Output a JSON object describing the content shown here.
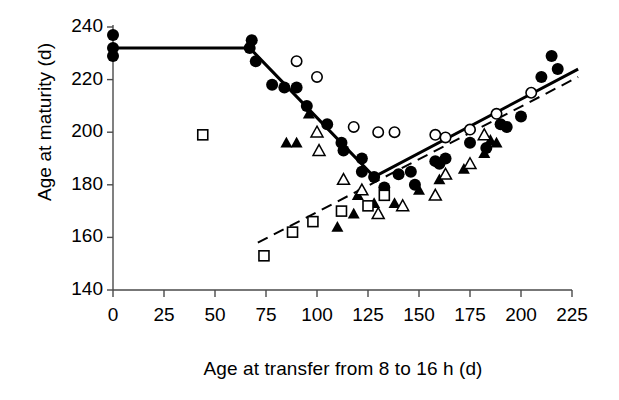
{
  "chart_data": {
    "type": "scatter",
    "title": "",
    "xlabel": "Age at transfer from 8 to 16 h (d)",
    "ylabel": "Age at maturity (d)",
    "xlim": [
      0,
      225
    ],
    "ylim": [
      140,
      240
    ],
    "xticks": [
      0,
      25,
      50,
      75,
      100,
      125,
      150,
      175,
      200,
      225
    ],
    "yticks": [
      140,
      160,
      180,
      200,
      220,
      240
    ],
    "grid": false,
    "legend": "none",
    "series": [
      {
        "name": "filled-circle",
        "marker": "filled-circle",
        "points": [
          [
            0,
            229
          ],
          [
            0,
            232
          ],
          [
            0,
            237
          ],
          [
            67,
            232
          ],
          [
            68,
            235
          ],
          [
            70,
            227
          ],
          [
            78,
            218
          ],
          [
            84,
            217
          ],
          [
            90,
            217
          ],
          [
            95,
            210
          ],
          [
            105,
            203
          ],
          [
            112,
            196
          ],
          [
            113,
            193
          ],
          [
            122,
            190
          ],
          [
            122,
            185
          ],
          [
            128,
            183
          ],
          [
            133,
            179
          ],
          [
            140,
            184
          ],
          [
            146,
            185
          ],
          [
            148,
            180
          ],
          [
            158,
            189
          ],
          [
            160,
            188
          ],
          [
            163,
            190
          ],
          [
            175,
            196
          ],
          [
            183,
            194
          ],
          [
            190,
            203
          ],
          [
            193,
            202
          ],
          [
            200,
            206
          ],
          [
            210,
            221
          ],
          [
            215,
            229
          ],
          [
            218,
            224
          ]
        ]
      },
      {
        "name": "open-circle",
        "marker": "open-circle",
        "points": [
          [
            90,
            227
          ],
          [
            100,
            221
          ],
          [
            118,
            202
          ],
          [
            130,
            200
          ],
          [
            138,
            200
          ],
          [
            158,
            199
          ],
          [
            163,
            198
          ],
          [
            175,
            201
          ],
          [
            188,
            207
          ],
          [
            205,
            215
          ]
        ]
      },
      {
        "name": "filled-triangle",
        "marker": "filled-triangle",
        "points": [
          [
            85,
            196
          ],
          [
            90,
            196
          ],
          [
            96,
            207
          ],
          [
            110,
            164
          ],
          [
            118,
            169
          ],
          [
            120,
            176
          ],
          [
            128,
            173
          ],
          [
            138,
            173
          ],
          [
            150,
            178
          ],
          [
            160,
            182
          ],
          [
            172,
            186
          ],
          [
            182,
            192
          ],
          [
            185,
            197
          ],
          [
            188,
            196
          ]
        ]
      },
      {
        "name": "open-triangle",
        "marker": "open-triangle",
        "points": [
          [
            100,
            200
          ],
          [
            101,
            193
          ],
          [
            113,
            182
          ],
          [
            122,
            178
          ],
          [
            130,
            169
          ],
          [
            142,
            172
          ],
          [
            158,
            176
          ],
          [
            163,
            184
          ],
          [
            175,
            188
          ],
          [
            182,
            199
          ]
        ]
      },
      {
        "name": "open-square",
        "marker": "open-square",
        "points": [
          [
            44,
            199
          ],
          [
            74,
            153
          ],
          [
            88,
            162
          ],
          [
            98,
            166
          ],
          [
            112,
            170
          ],
          [
            125,
            172
          ],
          [
            133,
            176
          ]
        ]
      }
    ],
    "lines": [
      {
        "name": "solid-fitted-line",
        "style": "solid",
        "width": 3,
        "vertices": [
          [
            0,
            232
          ],
          [
            67,
            232
          ],
          [
            128,
            183
          ],
          [
            228,
            224
          ]
        ]
      },
      {
        "name": "dashed-fitted-line",
        "style": "dashed",
        "width": 2,
        "vertices": [
          [
            71,
            158
          ],
          [
            228,
            221
          ]
        ]
      }
    ]
  },
  "axes": {
    "y_title": "Age at maturity (d)",
    "x_title": "Age at transfer from 8 to 16 h (d)",
    "y_tick_labels": [
      "240",
      "220",
      "200",
      "180",
      "160",
      "140"
    ],
    "x_tick_labels": [
      "0",
      "25",
      "50",
      "75",
      "100",
      "125",
      "150",
      "175",
      "200",
      "225"
    ]
  },
  "colors": {
    "ink": "#000000",
    "axis": "#4a4a4a",
    "background": "#ffffff"
  }
}
